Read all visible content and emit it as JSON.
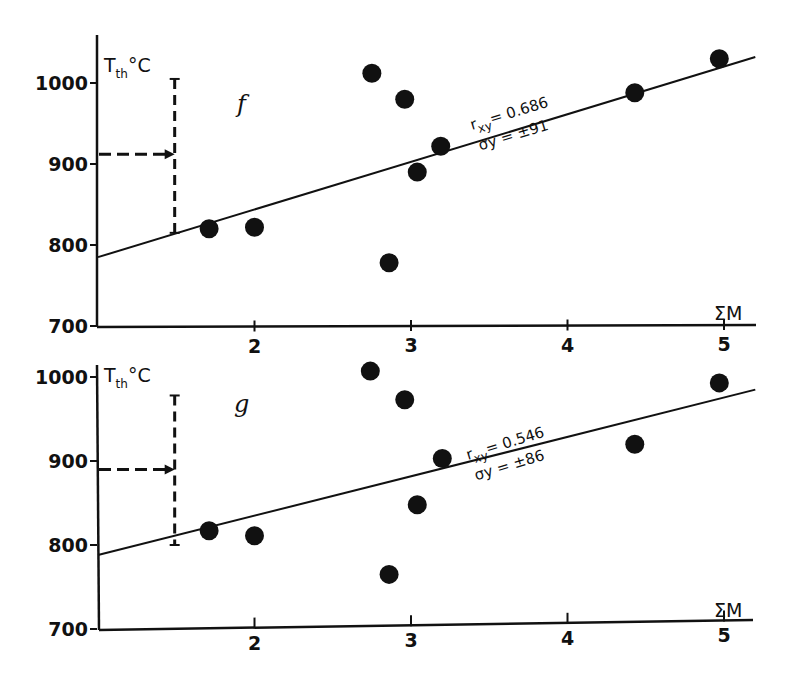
{
  "chart_data": [
    {
      "type": "scatter",
      "panel": "f",
      "title": "",
      "xlabel": "ΣM",
      "ylabel": "T_th °C",
      "ylabel_main": "T",
      "ylabel_sub": "th",
      "ylabel_unit": "°C",
      "xlim": [
        1,
        5.2
      ],
      "ylim": [
        700,
        1060
      ],
      "x_ticks": [
        "2",
        "3",
        "4",
        "5"
      ],
      "y_ticks": [
        "700",
        "800",
        "900",
        "1000"
      ],
      "grid": false,
      "points": [
        {
          "x": 1.71,
          "y": 820
        },
        {
          "x": 2.0,
          "y": 822
        },
        {
          "x": 2.75,
          "y": 1012
        },
        {
          "x": 2.86,
          "y": 778
        },
        {
          "x": 2.96,
          "y": 980
        },
        {
          "x": 3.04,
          "y": 890
        },
        {
          "x": 3.19,
          "y": 922
        },
        {
          "x": 4.43,
          "y": 988
        },
        {
          "x": 4.97,
          "y": 1030
        }
      ],
      "regression_line": {
        "x0": 1.0,
        "y0": 785,
        "x1": 5.2,
        "y1": 1032
      },
      "annotation_r": "r",
      "annotation_r_sub": "xy",
      "annotation_r_val": "= 0.686",
      "annotation_sigma": "σy = ±91",
      "error_bar": {
        "x": 1.49,
        "y_low": 815,
        "y_high": 1005,
        "arrow_y": 912
      }
    },
    {
      "type": "scatter",
      "panel": "g",
      "title": "",
      "xlabel": "ΣM",
      "ylabel": "T_th °C",
      "ylabel_main": "T",
      "ylabel_sub": "th",
      "ylabel_unit": "°C",
      "xlim": [
        1,
        5.2
      ],
      "ylim": [
        700,
        1010
      ],
      "x_ticks": [
        "2",
        "3",
        "4",
        "5"
      ],
      "y_ticks": [
        "700",
        "800",
        "900",
        "1000"
      ],
      "grid": false,
      "points": [
        {
          "x": 1.71,
          "y": 817
        },
        {
          "x": 2.0,
          "y": 811
        },
        {
          "x": 2.74,
          "y": 1007
        },
        {
          "x": 2.86,
          "y": 765
        },
        {
          "x": 2.96,
          "y": 973
        },
        {
          "x": 3.04,
          "y": 848
        },
        {
          "x": 3.2,
          "y": 903
        },
        {
          "x": 4.43,
          "y": 920
        },
        {
          "x": 4.97,
          "y": 993
        }
      ],
      "regression_line": {
        "x0": 1.0,
        "y0": 788,
        "x1": 5.2,
        "y1": 985
      },
      "annotation_r": "r",
      "annotation_r_sub": "xy",
      "annotation_r_val": "= 0.546",
      "annotation_sigma": "σy = ±86",
      "error_bar": {
        "x": 1.49,
        "y_low": 800,
        "y_high": 978,
        "arrow_y": 890
      }
    }
  ]
}
